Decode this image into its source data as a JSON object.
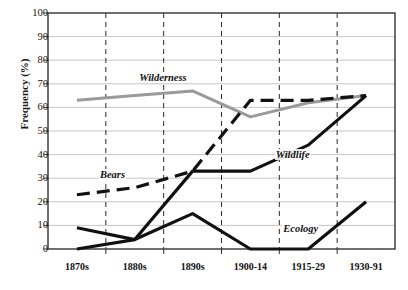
{
  "chart_data": {
    "type": "line",
    "title": "",
    "xlabel": "",
    "ylabel": "Frequency (%)",
    "categories": [
      "1870s",
      "1880s",
      "1890s",
      "1900-14",
      "1915-29",
      "1930-91"
    ],
    "ylim": [
      0,
      100
    ],
    "yticks": [
      0,
      10,
      20,
      30,
      40,
      50,
      60,
      70,
      80,
      90,
      100
    ],
    "grid": "horizontal-solid-and-vertical-dashed",
    "legend": "inline-labels",
    "series": [
      {
        "name": "Wilderness",
        "style": "solid-gray",
        "color": "#9a9a9a",
        "values": [
          63,
          65,
          67,
          56,
          62,
          65
        ],
        "label_x": 1.06,
        "label_y": 72.5
      },
      {
        "name": "Bears",
        "style": "dashed-black",
        "color": "#111111",
        "values": [
          23,
          26,
          33,
          63,
          63,
          65
        ],
        "label_x": 0.38,
        "label_y": 31.5
      },
      {
        "name": "Wildlife",
        "style": "solid-black",
        "color": "#111111",
        "values": [
          0,
          4,
          33,
          33,
          44,
          65
        ],
        "label_x": 3.42,
        "label_y": 40.0
      },
      {
        "name": "Ecology",
        "style": "solid-black",
        "color": "#111111",
        "values": [
          9,
          4,
          15,
          0,
          0,
          20
        ],
        "label_x": 3.55,
        "label_y": 8.5
      }
    ]
  },
  "axis": {
    "y_label": "Frequency (%)",
    "y_tick_labels": [
      "100",
      "90",
      "80",
      "70",
      "60",
      "50",
      "40",
      "30",
      "20",
      "10",
      "0"
    ],
    "x_tick_labels": [
      "1870s",
      "1880s",
      "1890s",
      "1900-14",
      "1915-29",
      "1930-91"
    ]
  },
  "caption": {
    "text": ""
  },
  "colors": {
    "wilderness": "#9a9a9a",
    "ink": "#111111",
    "grid": "#b8b8b8",
    "frame": "#333333",
    "background": "#ffffff"
  }
}
